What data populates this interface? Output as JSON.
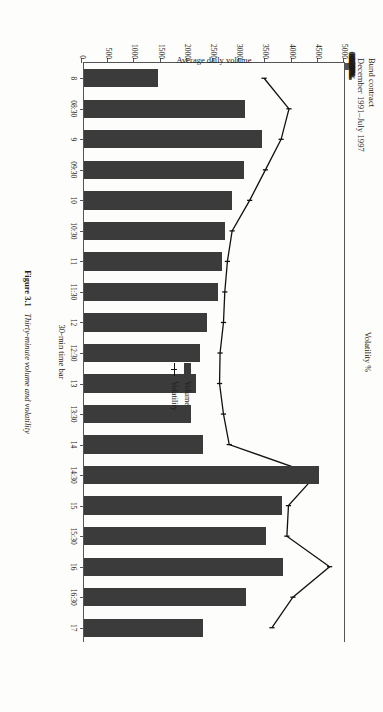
{
  "header": {
    "line1": "Bund contract",
    "line2": "December 1991–July 1997"
  },
  "caption": {
    "label": "Figure 3.1",
    "text": "Thirty-minute volume and volatility"
  },
  "legend": {
    "position": "inside-plot-left",
    "items": [
      {
        "label": "Volume",
        "marker": "bar-swatch",
        "color": "#3b3b3b"
      },
      {
        "label": "Volatility",
        "marker": "line-with-cross-marker",
        "color": "#111111"
      }
    ]
  },
  "axes": {
    "x_title": "30-min time bar",
    "y_left_title": "Average daily volume",
    "y_right_title": "Volatility %",
    "y_left_ticks": [
      "0",
      "500",
      "1000",
      "1500",
      "2000",
      "2500",
      "3000",
      "3500",
      "4000",
      "4500",
      "5000"
    ],
    "y_right_ticks": [
      "0.000%",
      "0.010%",
      "0.020%",
      "0.030%",
      "0.040%",
      "0.050%",
      "0.060%",
      "0.070%",
      "0.080%",
      "0.090%",
      "0.100%"
    ]
  },
  "chart_data": {
    "type": "bar",
    "title": "Bund contract December 1991–July 1997",
    "xlabel": "30-min time bar",
    "ylabel": "Average daily volume",
    "y2label": "Volatility %",
    "ylim": [
      0,
      5000
    ],
    "y2lim": [
      0,
      0.1
    ],
    "grid": false,
    "legend_position": "inside-left",
    "categories": [
      "8",
      "08:30",
      "9",
      "09:30",
      "10",
      "10:30",
      "11",
      "11:30",
      "12",
      "12:30",
      "13",
      "13:30",
      "14",
      "14:30",
      "15",
      "15:30",
      "16",
      "16:30",
      "17"
    ],
    "series": [
      {
        "name": "Volume",
        "type": "bar",
        "axis": "left",
        "color": "#3b3b3b",
        "values": [
          1420,
          3080,
          3400,
          3060,
          2820,
          2700,
          2630,
          2550,
          2350,
          2210,
          2130,
          2050,
          2280,
          4480,
          3770,
          3480,
          3800,
          3100,
          2270
        ]
      },
      {
        "name": "Volatility",
        "type": "line",
        "axis": "right",
        "color": "#111111",
        "values": [
          0.0695,
          0.079,
          0.076,
          0.07,
          0.064,
          0.0573,
          0.0555,
          0.0545,
          0.054,
          0.0527,
          0.0525,
          0.054,
          0.0562,
          0.0893,
          0.0788,
          0.0782,
          0.0945,
          0.0805,
          0.0725
        ]
      }
    ]
  }
}
